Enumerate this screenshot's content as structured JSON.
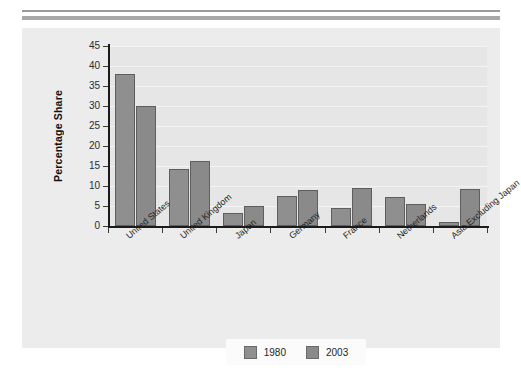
{
  "chart_data": {
    "type": "bar",
    "title": "",
    "subtitle": "",
    "xlabel": "",
    "ylabel": "Percentage Share",
    "ylim": [
      0,
      45
    ],
    "ytick_step": 5,
    "yticks": [
      "45",
      "40",
      "35",
      "30",
      "25",
      "20",
      "15",
      "10",
      "5",
      "0"
    ],
    "grid": true,
    "grid_axis": "y",
    "legend_position": "bottom-center",
    "categories": [
      "United States",
      "United Kingdom",
      "Japan",
      "Germany",
      "France",
      "Netherlands",
      "Asia Excluding Japan"
    ],
    "series": [
      {
        "name": "1980",
        "color": "#8f8f8f",
        "values": [
          38.0,
          14.3,
          3.3,
          7.5,
          4.4,
          7.2,
          1.0
        ]
      },
      {
        "name": "2003",
        "color": "#8a8a8a",
        "values": [
          30.0,
          16.3,
          5.0,
          9.0,
          9.4,
          5.6,
          9.3
        ]
      }
    ]
  },
  "legend": {
    "items": [
      {
        "label": "1980"
      },
      {
        "label": "2003"
      }
    ]
  },
  "colors": {
    "page_background": "#ffffff",
    "panel_background": "#ececec",
    "plot_background": "#e6e6e6",
    "gridline": "#f4f4f4",
    "axis": "#1b1b1b",
    "bar_1980": "#8f8f8f",
    "bar_2003": "#8a8a8a",
    "bar_outline": "#5e5e5e",
    "rule_bar": "#a8a8a8",
    "text": "#1f1f1f"
  }
}
